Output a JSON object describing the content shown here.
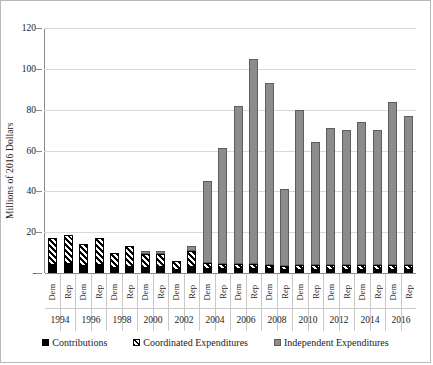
{
  "chart_data": {
    "type": "bar",
    "stacked": true,
    "title": "",
    "xlabel": "",
    "ylabel": "Millions of 2016 Dollars",
    "ylim": [
      0,
      120
    ],
    "yticks": [
      "-",
      "20",
      "40",
      "60",
      "80",
      "100",
      "120"
    ],
    "ytick_values": [
      0,
      20,
      40,
      60,
      80,
      100,
      120
    ],
    "grid": true,
    "legend_position": "bottom",
    "years": [
      "1994",
      "1996",
      "1998",
      "2000",
      "2002",
      "2004",
      "2006",
      "2008",
      "2010",
      "2012",
      "2014",
      "2016"
    ],
    "parties": [
      "Dem",
      "Rep"
    ],
    "categories": [
      "1994 Dem",
      "1994 Rep",
      "1996 Dem",
      "1996 Rep",
      "1998 Dem",
      "1998 Rep",
      "2000 Dem",
      "2000 Rep",
      "2002 Dem",
      "2002 Rep",
      "2004 Dem",
      "2004 Rep",
      "2006 Dem",
      "2006 Rep",
      "2008 Dem",
      "2008 Rep",
      "2010 Dem",
      "2010 Rep",
      "2012 Dem",
      "2012 Rep",
      "2014 Dem",
      "2014 Rep",
      "2016 Dem",
      "2016 Rep"
    ],
    "series": [
      {
        "name": "Contributions",
        "color": "#000000",
        "pattern": "solid-black",
        "values": [
          4.0,
          4.5,
          3.5,
          4.0,
          2.5,
          3.0,
          2.5,
          3.0,
          1.5,
          3.0,
          2.0,
          2.0,
          2.0,
          2.0,
          2.0,
          1.5,
          1.5,
          1.5,
          1.5,
          1.5,
          1.5,
          1.5,
          1.5,
          1.5
        ]
      },
      {
        "name": "Coordinated Expenditures",
        "color": "#000000",
        "pattern": "diagonal-hatch",
        "values": [
          13.0,
          14.0,
          10.5,
          13.0,
          7.5,
          10.0,
          7.0,
          6.5,
          4.5,
          8.0,
          3.0,
          2.5,
          2.5,
          2.5,
          2.0,
          2.0,
          2.5,
          2.5,
          2.5,
          2.5,
          2.5,
          2.5,
          2.5,
          2.5
        ]
      },
      {
        "name": "Independent Expenditures",
        "color": "#8c8c8c",
        "pattern": "solid-gray",
        "values": [
          0,
          0,
          0,
          0,
          0,
          0,
          1.5,
          1.5,
          0,
          2.0,
          40.0,
          56.5,
          77.5,
          100.5,
          89.0,
          37.5,
          76.0,
          60.0,
          67.0,
          66.0,
          70.0,
          66.0,
          80.0,
          73.0
        ]
      }
    ],
    "totals": [
      17.0,
      18.5,
      14.0,
      17.0,
      10.0,
      13.0,
      11.0,
      11.0,
      6.0,
      13.0,
      45.0,
      61.0,
      82.0,
      105.0,
      93.0,
      41.0,
      80.0,
      64.0,
      71.0,
      70.0,
      74.0,
      70.0,
      84.0,
      77.0
    ]
  },
  "legend": {
    "items": [
      {
        "label": "Contributions"
      },
      {
        "label": "Coordinated Expenditures"
      },
      {
        "label": "Independent Expenditures"
      }
    ]
  }
}
